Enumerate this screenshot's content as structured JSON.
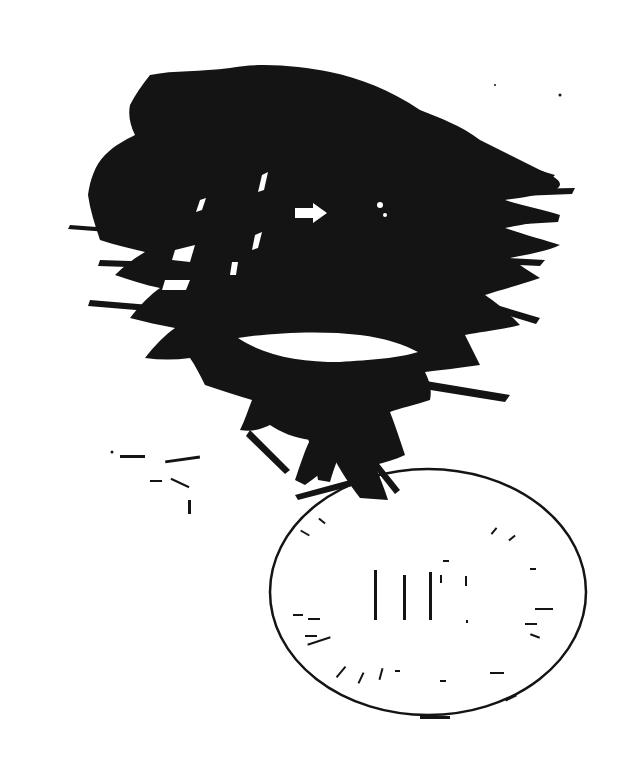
{
  "image": {
    "description": "Degraded black-and-white scan of a tree silhouette with a white arrow and an oval stamp",
    "background_color": "#ffffff",
    "ink_color": "#141414"
  },
  "stamp": {
    "center_text": "IHC",
    "center_text_note": "faint, partially legible"
  },
  "icons": {
    "arrow": "right-arrow-icon"
  }
}
